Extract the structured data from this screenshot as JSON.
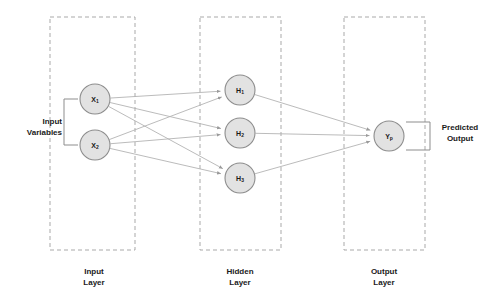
{
  "diagram": {
    "type": "neural-network",
    "colors": {
      "node_fill": "#e2e2e2",
      "node_stroke": "#8d8d8d",
      "edge": "#b3b3b3",
      "box_stroke": "#a9a9a9",
      "text": "#1a1a1a",
      "background": "#ffffff"
    }
  },
  "side_labels": {
    "input_variables": "Input\nVariables",
    "predicted_output": "Predicted\nOutput"
  },
  "layers": [
    {
      "id": "input",
      "caption": "Input\nLayer",
      "box": {
        "x": 50,
        "y": 17,
        "width": 85,
        "height": 233
      },
      "nodes": [
        {
          "id": "x1",
          "base": "X",
          "sub": "1",
          "cx": 95,
          "cy": 99,
          "r": 15
        },
        {
          "id": "x2",
          "base": "X",
          "sub": "2",
          "cx": 95,
          "cy": 145,
          "r": 15
        }
      ]
    },
    {
      "id": "hidden",
      "caption": "Hidden\nLayer",
      "box": {
        "x": 200,
        "y": 17,
        "width": 81,
        "height": 233
      },
      "nodes": [
        {
          "id": "h1",
          "base": "H",
          "sub": "1",
          "cx": 240,
          "cy": 90,
          "r": 15
        },
        {
          "id": "h2",
          "base": "H",
          "sub": "2",
          "cx": 240,
          "cy": 133,
          "r": 15
        },
        {
          "id": "h3",
          "base": "H",
          "sub": "3",
          "cx": 240,
          "cy": 178,
          "r": 15
        }
      ]
    },
    {
      "id": "output",
      "caption": "Output\nLayer",
      "box": {
        "x": 344,
        "y": 17,
        "width": 81,
        "height": 233
      },
      "nodes": [
        {
          "id": "yp",
          "base": "Y",
          "sub": "p",
          "cx": 389,
          "cy": 136,
          "r": 15
        }
      ]
    }
  ],
  "connections": [
    {
      "from": "x1",
      "to": "h1"
    },
    {
      "from": "x1",
      "to": "h2"
    },
    {
      "from": "x1",
      "to": "h3"
    },
    {
      "from": "x2",
      "to": "h1"
    },
    {
      "from": "x2",
      "to": "h2"
    },
    {
      "from": "x2",
      "to": "h3"
    },
    {
      "from": "h1",
      "to": "yp"
    },
    {
      "from": "h2",
      "to": "yp"
    },
    {
      "from": "h3",
      "to": "yp"
    }
  ]
}
